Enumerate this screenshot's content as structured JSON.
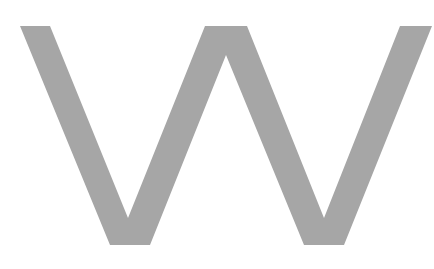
{
  "glyph": {
    "character": "W",
    "fill_color": "#a6a6a6",
    "background_color": "#ffffff"
  }
}
